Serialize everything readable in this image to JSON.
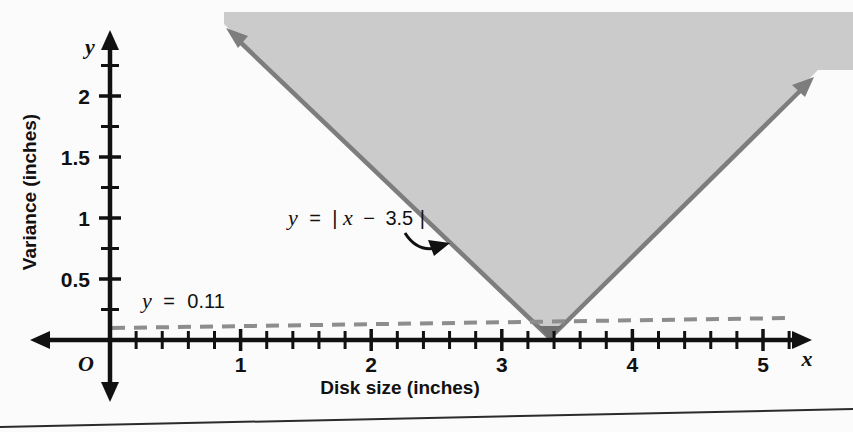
{
  "chart_data": {
    "type": "line",
    "title": "",
    "xlabel": "Disk size (inches)",
    "ylabel": "Variance (inches)",
    "x_axis_var": "x",
    "y_axis_var": "y",
    "origin_label": "O",
    "xlim": [
      -0.2,
      5.5
    ],
    "ylim": [
      -0.2,
      2.35
    ],
    "x_ticks_major": [
      1,
      2,
      3,
      4,
      5
    ],
    "x_tick_labels": [
      "1",
      "2",
      "3",
      "4",
      "5"
    ],
    "x_tick_minor_step": 0.2,
    "y_ticks_major": [
      0.5,
      1,
      1.5,
      2
    ],
    "y_tick_labels": [
      "0.5",
      "1",
      "1.5",
      "2"
    ],
    "y_tick_minor_step": 0.25,
    "grid": false,
    "legend": "none",
    "series": [
      {
        "name": "absolute-value-boundary",
        "label": "y = |x − 3.5|",
        "equation": "y = |x - 3.5|",
        "vertex": [
          3.5,
          0
        ],
        "type": "line",
        "style": "solid",
        "color": "#7d7d7d",
        "shaded_above": true,
        "shade_color": "#cbcbcb",
        "points": [
          [
            1.0,
            2.5
          ],
          [
            3.5,
            0.0
          ],
          [
            5.38,
            1.88
          ]
        ]
      },
      {
        "name": "tolerance-line",
        "label": "y = 0.11",
        "equation": "y = 0.11",
        "type": "line",
        "style": "dashed",
        "color": "#8d8d8d",
        "value": 0.11,
        "points": [
          [
            0.0,
            0.11
          ],
          [
            5.45,
            0.165
          ]
        ]
      }
    ],
    "annotations": [
      {
        "name": "boundary-equation-annotation",
        "text": "y = |x − 3.5|",
        "pointer": "curved-arrow-right"
      },
      {
        "name": "tolerance-equation-annotation",
        "text": "y = 0.11",
        "pointer": "none"
      }
    ]
  },
  "labels": {
    "eq_boundary_lhs": "y",
    "eq_boundary_eq": "=",
    "eq_boundary_abs_open": "|",
    "eq_boundary_x": "x",
    "eq_boundary_minus": "−",
    "eq_boundary_num": "3.5",
    "eq_boundary_abs_close": "|",
    "eq_tolerance_lhs": "y",
    "eq_tolerance_eq": "=",
    "eq_tolerance_num": "0.11"
  },
  "colors": {
    "shade_fill": "#cbcbcb",
    "boundary_stroke": "#7d7d7d",
    "dashed_stroke": "#8d8d8d",
    "axis": "#111111",
    "page_bg": "#fbfbfb",
    "rule": "#2b2b2b"
  }
}
